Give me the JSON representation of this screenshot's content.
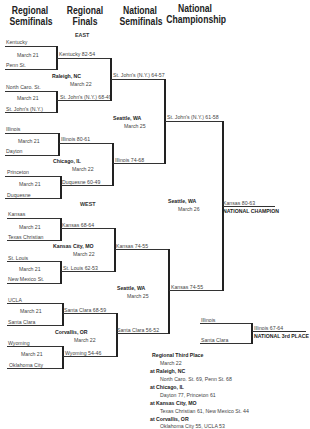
{
  "headers": {
    "col1": "Regional Semifinals",
    "col2": "Regional Finals",
    "col3": "National Semifinals",
    "col4": "National Championship"
  },
  "regions": {
    "east": "EAST",
    "west": "WEST"
  },
  "bracket": {
    "east": {
      "r1": [
        {
          "top": "Kentucky",
          "date": "March 21",
          "bottom": "Penn St."
        },
        {
          "top": "North Caro. St.",
          "date": "March 21",
          "bottom": "St. John's (N.Y.)"
        },
        {
          "top": "Illinois",
          "date": "March 21",
          "bottom": "Dayton"
        },
        {
          "top": "Princeton",
          "date": "March 21",
          "bottom": "Duquesne"
        }
      ],
      "r2": [
        {
          "top": "Kentucky 82-54",
          "site": "Raleigh, NC",
          "date": "March 22",
          "bottom": "St. John's (N.Y.) 68-49"
        },
        {
          "top": "Illinois 80-61",
          "site": "Chicago, IL",
          "date": "March 22",
          "bottom": "Duquesne 60-49"
        }
      ],
      "r3": {
        "top": "St. John's (N.Y.) 64-57",
        "site": "Seattle, WA",
        "date": "March 25",
        "bottom": "Illinois 74-68"
      }
    },
    "west": {
      "r1": [
        {
          "top": "Kansas",
          "date": "March 21",
          "bottom": "Texas Christian"
        },
        {
          "top": "St. Louis",
          "date": "March 21",
          "bottom": "New Mexico St."
        },
        {
          "top": "UCLA",
          "date": "March 21",
          "bottom": "Santa Clara"
        },
        {
          "top": "Wyoming",
          "date": "March 21",
          "bottom": "Oklahoma City"
        }
      ],
      "r2": [
        {
          "top": "Kansas 68-64",
          "site": "Kansas City, MO",
          "date": "March 22",
          "bottom": "St. Louis 62-53"
        },
        {
          "top": "Santa Clara 68-59",
          "site": "Corvallis, OR",
          "date": "March 22",
          "bottom": "Wyoming 54-46"
        }
      ],
      "r3": {
        "top": "Kansas 74-55",
        "site": "Seattle, WA",
        "date": "March 25",
        "bottom": "Santa Clara 56-52"
      }
    },
    "final": {
      "top": "St. John's (N.Y.) 61-58",
      "site": "Seattle, WA",
      "date": "March 26",
      "bottom": "Kansas 74-55",
      "champion": "Kansas 80-63",
      "champion_label": "NATIONAL CHAMPION"
    },
    "third": {
      "top": "Illinois",
      "bottom": "Santa Clara",
      "winner": "Illinois 67-64",
      "label": "NATIONAL 3rd PLACE"
    }
  },
  "third_place": {
    "title": "Regional Third Place",
    "date": "March 22",
    "games": [
      {
        "site": "at Raleigh, NC",
        "result": "North Caro. St. 69, Penn St. 68"
      },
      {
        "site": "at Chicago, IL",
        "result": "Dayton 77, Princeton 61"
      },
      {
        "site": "at Kansas City, MO",
        "result": "Texas Christian 61, New Mexico St. 44"
      },
      {
        "site": "at Corvallis, OR",
        "result": "Oklahoma City 55, UCLA 53"
      }
    ]
  }
}
